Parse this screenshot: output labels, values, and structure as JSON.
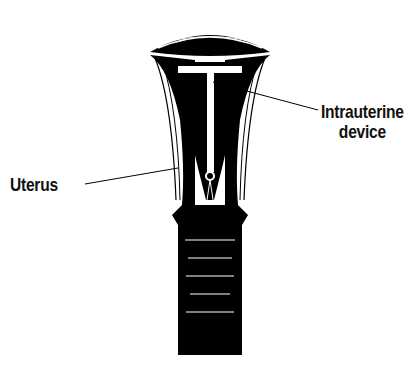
{
  "diagram": {
    "labels": [
      {
        "id": "iud",
        "lines": [
          "Intrauterine",
          "device"
        ],
        "points_to": "T-shaped device inside uterine cavity"
      },
      {
        "id": "uterus",
        "lines": [
          "Uterus"
        ],
        "points_to": "uterine wall"
      }
    ],
    "colors": {
      "ink": "#000000",
      "paper": "#ffffff"
    }
  }
}
